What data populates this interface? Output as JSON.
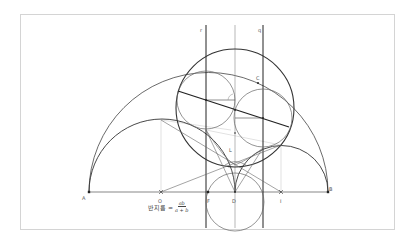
{
  "diagram": {
    "colors": {
      "background": "#ffffff",
      "frame_border": "#d4d4d4",
      "thick_stroke": "#333333",
      "thin_stroke": "#777777",
      "guide_stroke": "#c8c8c8"
    },
    "points": {
      "A": {
        "label": "A",
        "x": 89,
        "y": 192
      },
      "O": {
        "label": "O",
        "x": 161,
        "y": 192
      },
      "F": {
        "label": "F",
        "x": 208,
        "y": 192
      },
      "D": {
        "label": "D",
        "x": 235,
        "y": 192
      },
      "I": {
        "label": "I",
        "x": 281,
        "y": 192
      },
      "B": {
        "label": "B",
        "x": 328,
        "y": 192
      },
      "C": {
        "label": "C",
        "x": 256,
        "y": 82
      },
      "L": {
        "label": "L",
        "x": 231,
        "y": 151
      }
    },
    "lines": {
      "r": {
        "label": "r",
        "x": 206
      },
      "q": {
        "label": "q",
        "x": 263
      },
      "axis": {
        "x": 235
      }
    },
    "formula": {
      "lhs": "반지름 =",
      "numerator": "ab",
      "denominator": "a + b"
    }
  }
}
